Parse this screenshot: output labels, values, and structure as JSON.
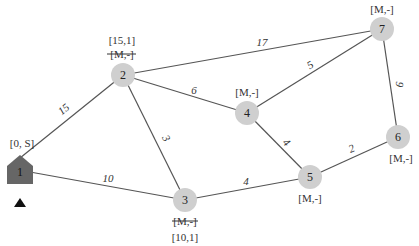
{
  "diagram": {
    "type": "weighted-graph-dijkstra",
    "source_node": "1",
    "nodes": [
      {
        "id": "1",
        "label": "1",
        "shape": "house",
        "labels": [
          "[0, S]"
        ],
        "struck": []
      },
      {
        "id": "2",
        "label": "2",
        "shape": "circle",
        "labels": [
          "[15,1]"
        ],
        "struck": [
          "[M,-]"
        ]
      },
      {
        "id": "3",
        "label": "3",
        "shape": "circle",
        "labels": [
          "[10,1]"
        ],
        "struck": [
          "[M,-]"
        ]
      },
      {
        "id": "4",
        "label": "4",
        "shape": "circle",
        "labels": [
          "[M,-]"
        ],
        "struck": []
      },
      {
        "id": "5",
        "label": "5",
        "shape": "circle",
        "labels": [
          "[M,-]"
        ],
        "struck": []
      },
      {
        "id": "6",
        "label": "6",
        "shape": "circle",
        "labels": [
          "[M,-]"
        ],
        "struck": []
      },
      {
        "id": "7",
        "label": "7",
        "shape": "circle",
        "labels": [
          "[M,-]"
        ],
        "struck": []
      }
    ],
    "edges": [
      {
        "from": "1",
        "to": "2",
        "weight": "15"
      },
      {
        "from": "1",
        "to": "3",
        "weight": "10"
      },
      {
        "from": "2",
        "to": "3",
        "weight": "3"
      },
      {
        "from": "2",
        "to": "4",
        "weight": "6"
      },
      {
        "from": "2",
        "to": "7",
        "weight": "17"
      },
      {
        "from": "4",
        "to": "7",
        "weight": "5"
      },
      {
        "from": "4",
        "to": "5",
        "weight": "4"
      },
      {
        "from": "3",
        "to": "5",
        "weight": "4"
      },
      {
        "from": "5",
        "to": "6",
        "weight": "2"
      },
      {
        "from": "6",
        "to": "7",
        "weight": "9"
      }
    ],
    "colors": {
      "node_fill": "#cfcfcf",
      "source_fill": "#666666",
      "edge": "#555555"
    }
  }
}
